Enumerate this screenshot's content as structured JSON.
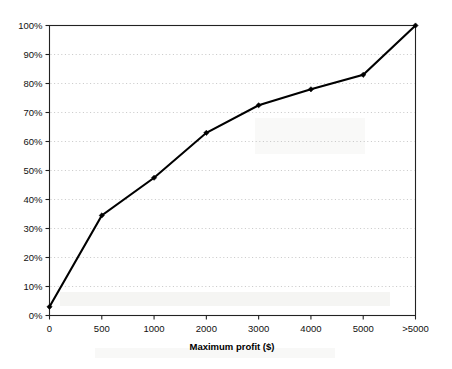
{
  "chart_data": {
    "type": "line",
    "title": "",
    "subtitle": "",
    "xlabel": "Maximum profit ($)",
    "ylabel": "",
    "categories": [
      "0",
      "500",
      "1000",
      "2000",
      "3000",
      "4000",
      "5000",
      ">5000"
    ],
    "values": [
      3,
      34.5,
      47.5,
      63,
      72.5,
      78,
      83,
      100
    ],
    "series": [
      {
        "name": "Cumulative percentage",
        "values": [
          3,
          34.5,
          47.5,
          63,
          72.5,
          78,
          83,
          100
        ]
      }
    ],
    "ylim": [
      0,
      100
    ],
    "ytick_step": 10,
    "ytick_labels": [
      "0%",
      "10%",
      "20%",
      "30%",
      "40%",
      "50%",
      "60%",
      "70%",
      "80%",
      "90%",
      "100%"
    ],
    "ytick_values": [
      0,
      10,
      20,
      30,
      40,
      50,
      60,
      70,
      80,
      90,
      100
    ],
    "grid": "horizontal-dotted",
    "legend": "none",
    "marker": "filled-diamond",
    "line_color": "#000000",
    "grid_color": "#b9b9b9",
    "axis_color": "#222222",
    "background_color": "#ffffff"
  },
  "axes": {
    "x_title": "Maximum profit ($)",
    "y_title": ""
  }
}
